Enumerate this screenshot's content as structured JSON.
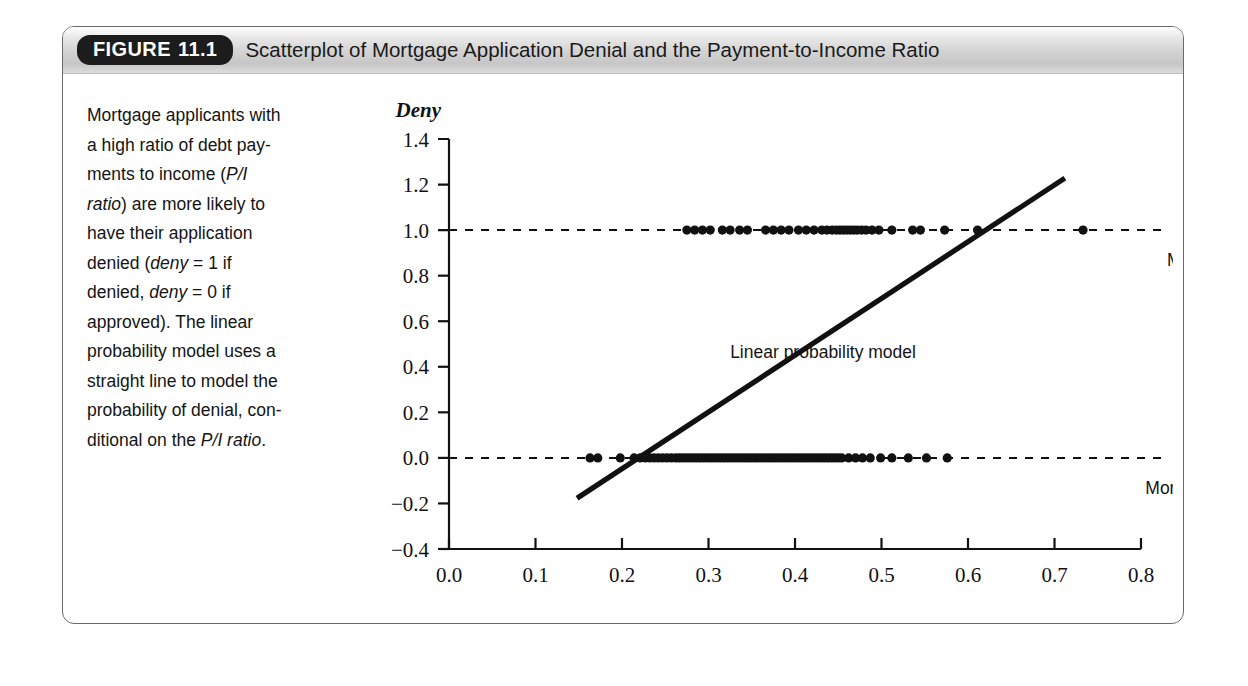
{
  "figure": {
    "label_prefix": "FIGURE",
    "label_number": "11.1",
    "title": "Scatterplot of Mortgage Application Denial and the Payment-to-Income Ratio"
  },
  "caption": {
    "line_1": "Mortgage applicants with",
    "line_2": "a high ratio of debt pay-",
    "line_3_a": "ments to income (",
    "line_3_i": "P/I",
    "line_4_i": "ratio",
    "line_4_b": ") are more likely to",
    "line_5": "have their application",
    "line_6_a": "denied (",
    "line_6_i": "deny",
    "line_6_b": " = 1 if",
    "line_7_a": "denied, ",
    "line_7_i": "deny",
    "line_7_b": " = 0 if",
    "line_8": "approved). The linear",
    "line_9": "probability model uses a",
    "line_10": "straight line to model the",
    "line_11": "probability of denial, con-",
    "line_12_a": "ditional on the ",
    "line_12_i": "P/I ratio",
    "line_12_b": "."
  },
  "annotations": {
    "mortgage_denied": "Mortgage denied",
    "mortgage_approved": "Mortgage approved",
    "linear_probability_model": "Linear probability model"
  },
  "colors": {
    "ink": "#111111",
    "frame": "#6a6a6a",
    "pill_bg": "#1c1c1c",
    "pill_text": "#ffffff"
  },
  "chart_data": {
    "type": "scatter",
    "title": "Scatterplot of Mortgage Application Denial and the Payment-to-Income Ratio",
    "xlabel": "P/I ratio",
    "ylabel": "Deny",
    "xlim": [
      0.0,
      0.8
    ],
    "ylim": [
      -0.4,
      1.4
    ],
    "xticks": [
      "0.0",
      "0.1",
      "0.2",
      "0.3",
      "0.4",
      "0.5",
      "0.6",
      "0.7",
      "0.8"
    ],
    "xtick_values": [
      0.0,
      0.1,
      0.2,
      0.3,
      0.4,
      0.5,
      0.6,
      0.7,
      0.8
    ],
    "yticks": [
      "1.4",
      "1.2",
      "1.0",
      "0.8",
      "0.6",
      "0.4",
      "0.2",
      "0.0",
      "−0.2",
      "−0.4"
    ],
    "ytick_values": [
      1.4,
      1.2,
      1.0,
      0.8,
      0.6,
      0.4,
      0.2,
      0.0,
      -0.2,
      -0.4
    ],
    "grid": false,
    "legend": "none",
    "reference_lines": [
      {
        "name": "mortgage-denied-line",
        "y": 1.0,
        "style": "dashed",
        "label": "Mortgage denied"
      },
      {
        "name": "mortgage-approved-line",
        "y": 0.0,
        "style": "dashed",
        "label": "Mortgage approved"
      }
    ],
    "fit_line": {
      "name": "linear-probability-model",
      "label": "Linear probability model",
      "x_start": 0.148,
      "y_start": -0.177,
      "x_end": 0.712,
      "y_end": 1.228,
      "slope": 2.49,
      "intercept": -0.546
    },
    "series": [
      {
        "name": "deny = 1 (denied)",
        "y": 1.0,
        "x": [
          0.275,
          0.284,
          0.293,
          0.302,
          0.316,
          0.325,
          0.336,
          0.345,
          0.366,
          0.375,
          0.384,
          0.393,
          0.404,
          0.413,
          0.422,
          0.431,
          0.437,
          0.443,
          0.448,
          0.452,
          0.456,
          0.46,
          0.464,
          0.468,
          0.472,
          0.477,
          0.482,
          0.489,
          0.497,
          0.512,
          0.536,
          0.545,
          0.573,
          0.611,
          0.733
        ]
      },
      {
        "name": "deny = 0 (approved)",
        "y": 0.0,
        "x": [
          0.163,
          0.172,
          0.198,
          0.214,
          0.221,
          0.227,
          0.232,
          0.237,
          0.242,
          0.247,
          0.252,
          0.257,
          0.262,
          0.266,
          0.27,
          0.274,
          0.278,
          0.282,
          0.286,
          0.29,
          0.294,
          0.298,
          0.302,
          0.306,
          0.31,
          0.314,
          0.318,
          0.322,
          0.326,
          0.33,
          0.334,
          0.338,
          0.342,
          0.346,
          0.35,
          0.354,
          0.358,
          0.362,
          0.366,
          0.37,
          0.374,
          0.378,
          0.382,
          0.386,
          0.39,
          0.394,
          0.398,
          0.402,
          0.406,
          0.41,
          0.414,
          0.418,
          0.422,
          0.426,
          0.43,
          0.434,
          0.438,
          0.442,
          0.446,
          0.45,
          0.454,
          0.462,
          0.47,
          0.478,
          0.487,
          0.499,
          0.512,
          0.531,
          0.552,
          0.576
        ]
      }
    ]
  }
}
